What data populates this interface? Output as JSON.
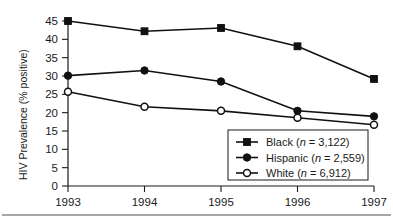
{
  "chart_data": {
    "type": "line",
    "title": "",
    "xlabel": "",
    "ylabel": "HIV Prevalence (% positive)",
    "categories": [
      "1993",
      "1994",
      "1995",
      "1996",
      "1997"
    ],
    "x": [
      1993,
      1994,
      1995,
      1996,
      1997
    ],
    "xlim": [
      1993,
      1997
    ],
    "ylim": [
      0,
      45
    ],
    "yticks": [
      0,
      5,
      10,
      15,
      20,
      25,
      30,
      35,
      40,
      45
    ],
    "ytick_labels": [
      "0",
      "5",
      "10",
      "15",
      "20",
      "25",
      "30",
      "35",
      "40",
      "45"
    ],
    "grid": false,
    "legend_position": "lower right",
    "series": [
      {
        "name": "Black",
        "n": "3,122",
        "legend_label": "Black (n = 3,122)",
        "marker": "filled-square",
        "color": "#111111",
        "values": [
          45.0,
          42.2,
          43.1,
          38.1,
          29.2
        ]
      },
      {
        "name": "Hispanic",
        "n": "2,559",
        "legend_label": "Hispanic (n = 2,559)",
        "marker": "filled-circle",
        "color": "#111111",
        "values": [
          30.1,
          31.5,
          28.5,
          20.5,
          19.0
        ]
      },
      {
        "name": "White",
        "n": "6,912",
        "legend_label": "White (n = 6,912)",
        "marker": "open-circle",
        "color": "#111111",
        "values": [
          25.7,
          21.6,
          20.5,
          18.6,
          16.7
        ]
      }
    ]
  },
  "legend": {
    "entries": [
      {
        "name": "Black",
        "prefix": "Black (",
        "italic_n": "n",
        "suffix": " = 3,122)"
      },
      {
        "name": "Hispanic",
        "prefix": "Hispanic (",
        "italic_n": "n",
        "suffix": " = 2,559)"
      },
      {
        "name": "White",
        "prefix": "White (",
        "italic_n": "n",
        "suffix": " = 6,912)"
      }
    ]
  },
  "axes": {
    "y_title": "HIV Prevalence (% positive)"
  }
}
